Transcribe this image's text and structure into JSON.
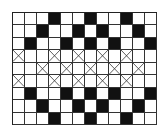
{
  "diagram": {
    "type": "weave-pattern-grid",
    "columns": 12,
    "rows": 9,
    "legend_colors": {
      "filled": "#111111",
      "empty": "#ffffff",
      "line": "#333333"
    },
    "cell_codes": {
      "W": "empty",
      "B": "filled",
      "X": "crossed"
    },
    "grid": [
      [
        "W",
        "W",
        "W",
        "B",
        "W",
        "W",
        "B",
        "W",
        "W",
        "B",
        "W",
        "W"
      ],
      [
        "W",
        "W",
        "B",
        "W",
        "W",
        "B",
        "W",
        "B",
        "W",
        "W",
        "B",
        "W"
      ],
      [
        "W",
        "B",
        "W",
        "W",
        "B",
        "W",
        "B",
        "W",
        "B",
        "W",
        "W",
        "B"
      ],
      [
        "X",
        "W",
        "W",
        "X",
        "W",
        "X",
        "W",
        "X",
        "W",
        "X",
        "W",
        "W"
      ],
      [
        "W",
        "W",
        "X",
        "W",
        "X",
        "W",
        "X",
        "W",
        "X",
        "W",
        "X",
        "W"
      ],
      [
        "X",
        "W",
        "W",
        "X",
        "W",
        "X",
        "W",
        "X",
        "W",
        "X",
        "W",
        "W"
      ],
      [
        "W",
        "B",
        "W",
        "W",
        "B",
        "W",
        "B",
        "W",
        "B",
        "W",
        "W",
        "B"
      ],
      [
        "W",
        "W",
        "B",
        "W",
        "W",
        "B",
        "W",
        "B",
        "W",
        "W",
        "B",
        "W"
      ],
      [
        "W",
        "W",
        "W",
        "B",
        "W",
        "W",
        "B",
        "W",
        "W",
        "B",
        "W",
        "W"
      ]
    ]
  }
}
